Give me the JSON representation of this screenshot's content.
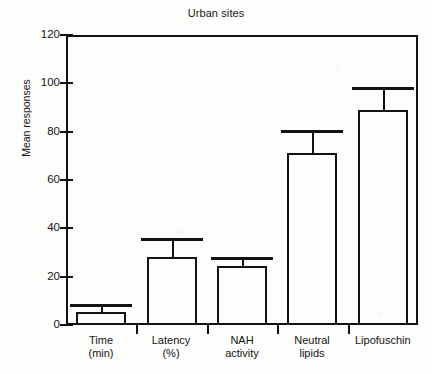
{
  "chart_data": {
    "type": "bar",
    "title": "Urban sites",
    "xlabel": "",
    "ylabel": "Mean responses",
    "ylim": [
      0,
      120
    ],
    "yticks": [
      0,
      20,
      40,
      60,
      80,
      100,
      120
    ],
    "ytick_labels": [
      "0",
      "20",
      "40",
      "60",
      "80",
      "100",
      "120"
    ],
    "grid": false,
    "legend": null,
    "error_bars": "upper only (one-sided SEM caps)",
    "bar_style": "open/unfilled black outline",
    "categories": [
      "Time\n(min)",
      "Latency\n(%)",
      "NAH\nactivity",
      "Neutral\nlipids",
      "Lipofuschin"
    ],
    "category_lines": [
      [
        "Time",
        "(min)"
      ],
      [
        "Latency",
        "(%)"
      ],
      [
        "NAH",
        "activity"
      ],
      [
        "Neutral",
        "lipids"
      ],
      [
        "Lipofuschin",
        ""
      ]
    ],
    "values": [
      5.5,
      28,
      24.5,
      71,
      89
    ],
    "error_upper": [
      3.0,
      8.0,
      3.5,
      9.5,
      9.5
    ],
    "error_top_values": [
      8.5,
      36.0,
      28.0,
      80.5,
      98.5
    ],
    "series": [
      {
        "name": "Mean responses",
        "values": [
          5.5,
          28,
          24.5,
          71,
          89
        ]
      }
    ],
    "colors": {
      "ink": "#121212",
      "background": "#fdfdfb"
    }
  },
  "figure": {
    "title_text": "Urban sites",
    "y_axis_title": "Mean responses"
  }
}
